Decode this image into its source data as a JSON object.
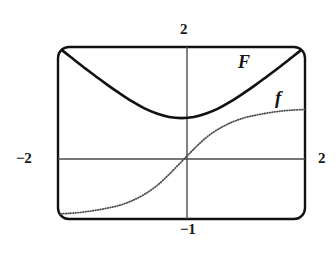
{
  "figure": {
    "kind": "graphing-calculator-plot",
    "background_color": "#ffffff",
    "frame": {
      "stroke_color": "#111111",
      "stroke_width": 2.4,
      "corner_radius": 11,
      "x": 58,
      "y": 47,
      "width": 247,
      "height": 172
    },
    "axes": {
      "stroke_color": "#4a4a4a",
      "stroke_width": 1.4,
      "x_axis_y": 159,
      "y_axis_x": 187
    }
  },
  "axis_labels": {
    "top": "2",
    "left": "−2",
    "right": "2",
    "bottom": "−1"
  },
  "curve_labels": {
    "F": "F",
    "f": "f"
  },
  "chart_data": {
    "type": "line",
    "title": "",
    "xlabel": "",
    "ylabel": "",
    "xlim": [
      -2,
      2
    ],
    "ylim": [
      -1,
      2
    ],
    "grid": false,
    "axis_tick_labels": {
      "top": "2",
      "left": "−2",
      "right": "2",
      "bottom": "−1"
    },
    "legend_position": "inline-curve-labels",
    "series": [
      {
        "name": "F",
        "label": "F",
        "style": "solid",
        "color": "#111111",
        "width": 2.6,
        "description": "U-shaped antiderivative curve, minimum near x=0.1, rising to the top-left and top-right frame corners",
        "points": [
          [
            -2.0,
            2.0
          ],
          [
            -1.8,
            1.83
          ],
          [
            -1.6,
            1.66
          ],
          [
            -1.4,
            1.5
          ],
          [
            -1.2,
            1.34
          ],
          [
            -1.0,
            1.19
          ],
          [
            -0.8,
            1.05
          ],
          [
            -0.6,
            0.93
          ],
          [
            -0.4,
            0.84
          ],
          [
            -0.2,
            0.78
          ],
          [
            0.0,
            0.76
          ],
          [
            0.2,
            0.78
          ],
          [
            0.4,
            0.84
          ],
          [
            0.6,
            0.93
          ],
          [
            0.8,
            1.05
          ],
          [
            1.0,
            1.19
          ],
          [
            1.2,
            1.34
          ],
          [
            1.4,
            1.5
          ],
          [
            1.6,
            1.66
          ],
          [
            1.8,
            1.83
          ],
          [
            2.0,
            2.0
          ]
        ]
      },
      {
        "name": "f",
        "label": "f",
        "style": "dotted",
        "color": "#4d4d4d",
        "width": 1.8,
        "description": "Increasing S-shaped (sigmoid / arctangent-like) derivative curve through the origin, flattening near both ends",
        "points": [
          [
            -2.0,
            -0.91
          ],
          [
            -1.8,
            -0.9
          ],
          [
            -1.6,
            -0.88
          ],
          [
            -1.4,
            -0.85
          ],
          [
            -1.2,
            -0.81
          ],
          [
            -1.0,
            -0.76
          ],
          [
            -0.8,
            -0.68
          ],
          [
            -0.6,
            -0.57
          ],
          [
            -0.4,
            -0.42
          ],
          [
            -0.2,
            -0.22
          ],
          [
            0.0,
            0.0
          ],
          [
            0.2,
            0.22
          ],
          [
            0.4,
            0.42
          ],
          [
            0.6,
            0.57
          ],
          [
            0.8,
            0.68
          ],
          [
            1.0,
            0.76
          ],
          [
            1.2,
            0.81
          ],
          [
            1.4,
            0.85
          ],
          [
            1.6,
            0.88
          ],
          [
            1.8,
            0.9
          ],
          [
            2.0,
            0.91
          ]
        ]
      }
    ]
  }
}
